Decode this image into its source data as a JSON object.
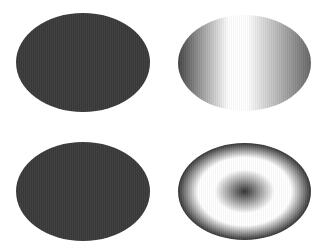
{
  "shapes": [
    {
      "name": "solid-dark-ellipse-top-left",
      "fill": "solid",
      "color": "#3a3a3a"
    },
    {
      "name": "horizontal-gradient-ellipse-top-right",
      "fill": "linear-gradient",
      "stops": [
        "#444444",
        "#ffffff",
        "#ffffff",
        "#666666"
      ]
    },
    {
      "name": "solid-dark-ellipse-bottom-left",
      "fill": "solid",
      "color": "#3a3a3a"
    },
    {
      "name": "radial-gradient-ellipse-bottom-right",
      "fill": "radial-gradient",
      "stops": [
        "#333333",
        "#ffffff",
        "#ffffff",
        "#333333"
      ]
    }
  ]
}
